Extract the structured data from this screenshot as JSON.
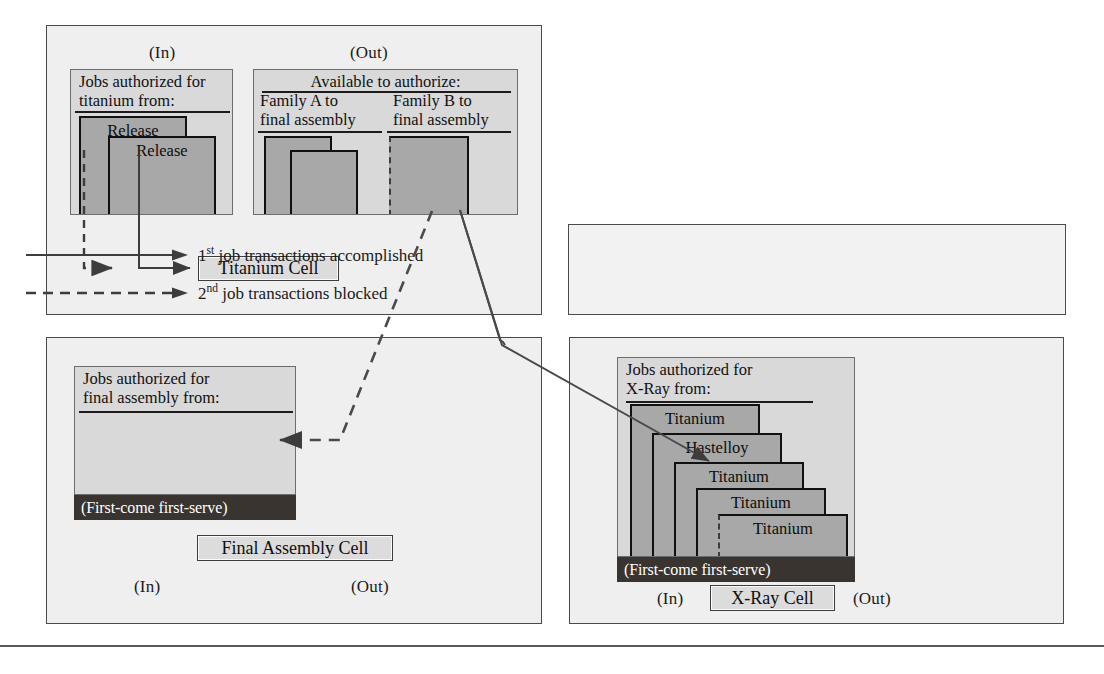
{
  "figure": {
    "panels": {
      "titanium_cell": {
        "in_label": "(In)",
        "out_label": "(Out)",
        "cell_name": "Titanium Cell",
        "in_board": {
          "title": "Jobs authorized for\ntitanium from:",
          "cards": [
            "Release",
            "Release"
          ]
        },
        "out_board": {
          "title": "Available to authorize:",
          "columns": [
            {
              "header": "Family A to\nfinal assembly",
              "cards": [
                "",
                ""
              ]
            },
            {
              "header": "Family B to\nfinal assembly",
              "cards": [
                ""
              ]
            }
          ]
        }
      },
      "final_assembly_cell": {
        "in_label": "(In)",
        "out_label": "(Out)",
        "cell_name": "Final Assembly Cell",
        "in_board": {
          "title": "Jobs authorized for\nfinal assembly from:",
          "queue_rule": "(First-come first-serve)",
          "cards": []
        }
      },
      "xray_cell": {
        "in_label": "(In)",
        "out_label": "(Out)",
        "cell_name": "X-Ray Cell",
        "in_board": {
          "title": "Jobs authorized for\nX-Ray from:",
          "queue_rule": "(First-come first-serve)",
          "cards": [
            "Titanium",
            "Hastelloy",
            "Titanium",
            "Titanium",
            "Titanium"
          ]
        }
      }
    },
    "legend": {
      "rows": [
        {
          "style": "solid",
          "prefix": "1",
          "sup": "st",
          "text": " job transactions accomplished"
        },
        {
          "style": "dashed",
          "prefix": "2",
          "sup": "nd",
          "text": " job transactions blocked"
        }
      ]
    },
    "colors": {
      "panel_fill": "#efefef",
      "board_fill": "#d9d9d9",
      "card_fill": "#a8a8a8",
      "card_border": "#111111",
      "fcfs_strip": "#3a3430",
      "plate_fill": "#dcdcdc",
      "line": "#4a4a4a"
    }
  }
}
